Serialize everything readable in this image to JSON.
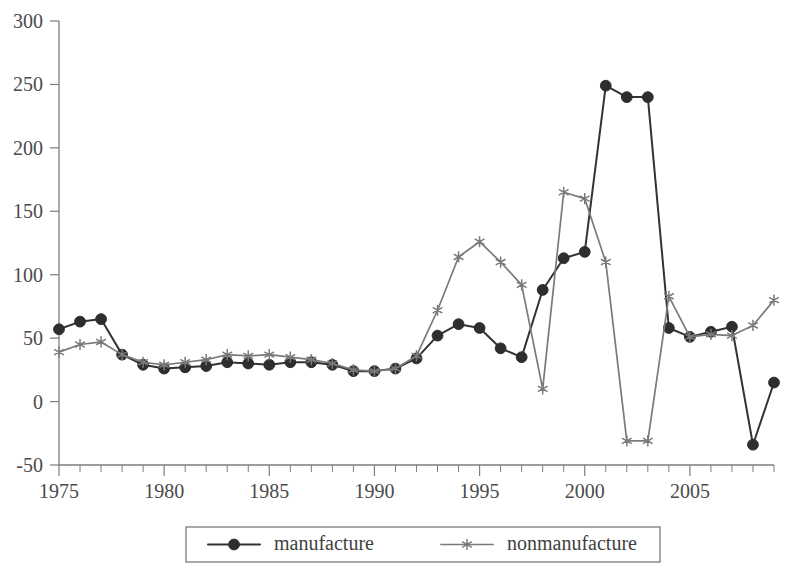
{
  "chart_data": {
    "type": "line",
    "title": "",
    "subtitle": "",
    "xlabel": "",
    "ylabel": "",
    "xlim": [
      1975,
      2009
    ],
    "ylim": [
      -50,
      300
    ],
    "grid": false,
    "legend_position": "bottom",
    "x": [
      1975,
      1976,
      1977,
      1978,
      1979,
      1980,
      1981,
      1982,
      1983,
      1984,
      1985,
      1986,
      1987,
      1988,
      1989,
      1990,
      1991,
      1992,
      1993,
      1994,
      1995,
      1996,
      1997,
      1998,
      1999,
      2000,
      2001,
      2002,
      2003,
      2004,
      2005,
      2006,
      2007,
      2008,
      2009
    ],
    "x_tick_labels": [
      "1975",
      "1980",
      "1985",
      "1990",
      "1995",
      "2000",
      "2005"
    ],
    "x_tick_values": [
      1975,
      1980,
      1985,
      1990,
      1995,
      2000,
      2005
    ],
    "x_minor_tick_step": 1,
    "y_tick_labels": [
      "300",
      "250",
      "200",
      "150",
      "100",
      "50",
      "0",
      "-50"
    ],
    "y_tick_values": [
      300,
      250,
      200,
      150,
      100,
      50,
      0,
      -50
    ],
    "series": [
      {
        "name": "manufacture",
        "marker": "filled-circle",
        "color": "#2e2e2e",
        "values": [
          57,
          63,
          65,
          37,
          29,
          26,
          27,
          28,
          31,
          30,
          29,
          31,
          31,
          29,
          24,
          24,
          26,
          34,
          52,
          61,
          58,
          42,
          35,
          88,
          113,
          118,
          249,
          240,
          240,
          58,
          51,
          55,
          59,
          -34,
          15
        ]
      },
      {
        "name": "nonmanufacture",
        "marker": "asterisk",
        "color": "#7a7a7a",
        "values": [
          39,
          45,
          47,
          37,
          31,
          29,
          31,
          33,
          37,
          36,
          37,
          35,
          33,
          30,
          25,
          24,
          26,
          36,
          72,
          114,
          126,
          110,
          92,
          10,
          165,
          160,
          110,
          -31,
          -31,
          83,
          51,
          53,
          52,
          60,
          80
        ]
      }
    ]
  },
  "legend": {
    "entries": [
      {
        "label": "manufacture",
        "marker": "filled-circle"
      },
      {
        "label": "nonmanufacture",
        "marker": "asterisk"
      }
    ]
  },
  "colors": {
    "manufacture": "#2e2e2e",
    "nonmanufacture": "#7a7a7a",
    "axis": "#7d7d7d",
    "background": "#ffffff"
  }
}
